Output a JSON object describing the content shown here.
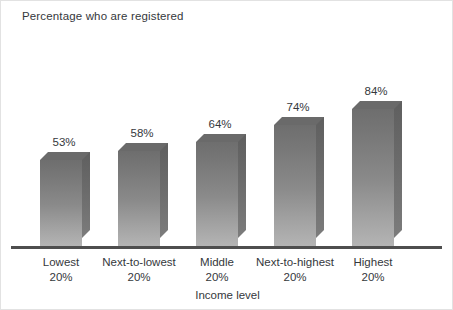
{
  "chart_data": {
    "type": "bar",
    "title": "Percentage who are registered",
    "xlabel": "Income level",
    "ylabel": "",
    "ylim": [
      0,
      100
    ],
    "grid": false,
    "legend": false,
    "style": "3d-extruded-bars",
    "categories": [
      "Lowest 20%",
      "Next-to-lowest 20%",
      "Middle 20%",
      "Next-to-highest 20%",
      "Highest 20%"
    ],
    "category_lines": [
      [
        "Lowest",
        "20%"
      ],
      [
        "Next-to-lowest",
        "20%"
      ],
      [
        "Middle",
        "20%"
      ],
      [
        "Next-to-highest",
        "20%"
      ],
      [
        "Highest",
        "20%"
      ]
    ],
    "values": [
      53,
      58,
      64,
      74,
      84
    ],
    "value_labels": [
      "53%",
      "58%",
      "64%",
      "74%",
      "84%"
    ],
    "bars": [
      {
        "label": "Lowest 20%",
        "line1": "Lowest",
        "line2": "20%",
        "value": 53,
        "value_label": "53%"
      },
      {
        "label": "Next-to-lowest 20%",
        "line1": "Next-to-lowest",
        "line2": "20%",
        "value": 58,
        "value_label": "58%"
      },
      {
        "label": "Middle 20%",
        "line1": "Middle",
        "line2": "20%",
        "value": 64,
        "value_label": "64%"
      },
      {
        "label": "Next-to-highest 20%",
        "line1": "Next-to-highest",
        "line2": "20%",
        "value": 74,
        "value_label": "74%"
      },
      {
        "label": "Highest 20%",
        "line1": "Highest",
        "line2": "20%",
        "value": 84,
        "value_label": "84%"
      }
    ]
  },
  "colors": {
    "background": "#ffffff",
    "text": "#35383c",
    "axis_line": "#4e4e4e",
    "bar_front_top": "#6e6e6e",
    "bar_front_bottom": "#b4b4b4",
    "bar_side": "#6b6b6b",
    "bar_top": "#6a6a6a",
    "frame_border": "#e2e2e2"
  }
}
